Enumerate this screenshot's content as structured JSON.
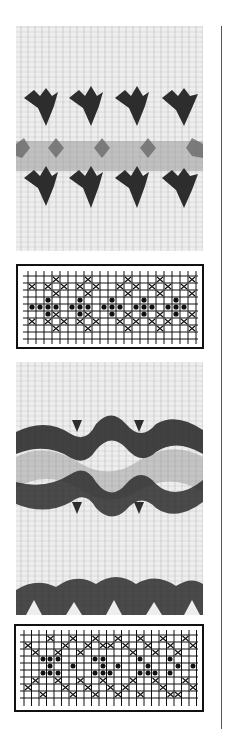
{
  "page": {
    "colors": {
      "background": "#ffffff",
      "yarn_light": "#eeeeee",
      "yarn_dark": "#2a2a2a",
      "yarn_mid": "#8a8a8a",
      "chart_ink": "#111111"
    }
  },
  "swatches": [
    {
      "name": "swatch-1",
      "motif": "small stars/diamonds in two rows with grey band between",
      "motifs_per_row": 4
    },
    {
      "name": "swatch-2",
      "motif": "zigzag wave band with grey fill, partial second band below",
      "motifs_per_row": 3
    }
  ],
  "charts": [
    {
      "name": "chart-1",
      "cols": 22,
      "rows": 9,
      "symbols": {
        "cross": "contrast color 1",
        "dot": "contrast color 2"
      }
    },
    {
      "name": "chart-2",
      "cols": 24,
      "rows": 10,
      "symbols": {
        "cross": "contrast color 1",
        "dot": "contrast color 2"
      }
    }
  ]
}
